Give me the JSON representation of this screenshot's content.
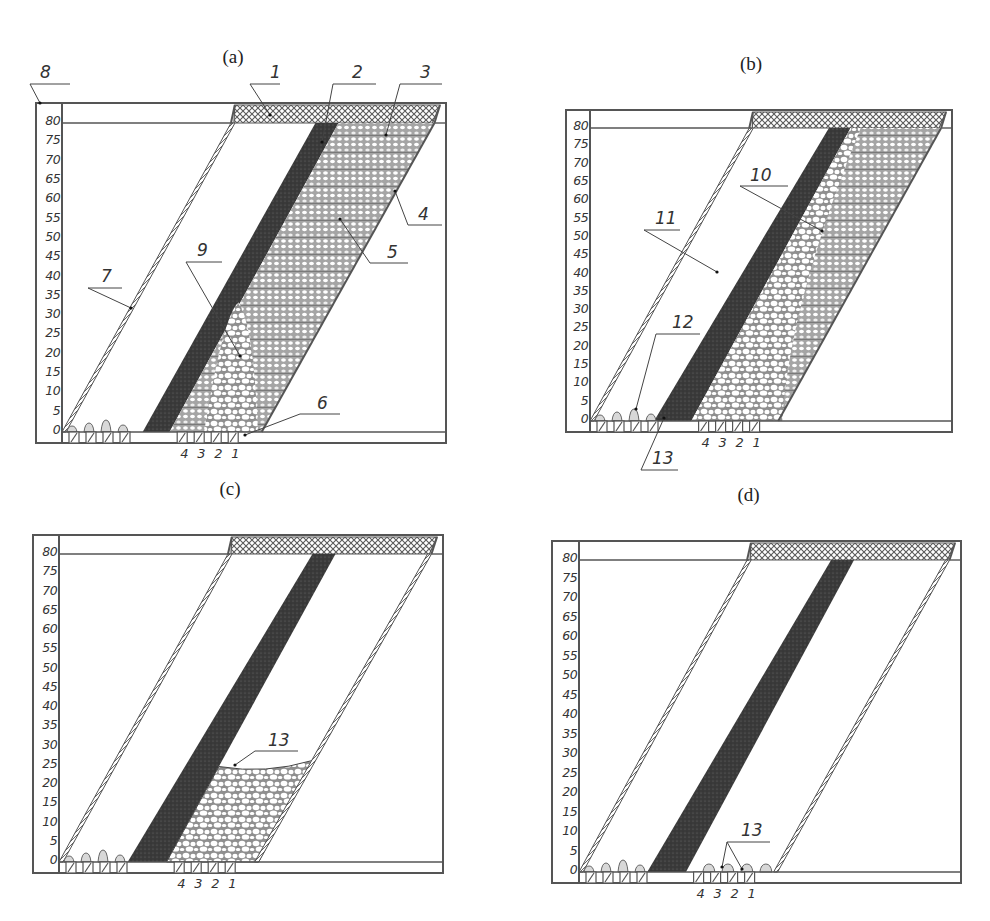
{
  "figure": {
    "scale_ticks": [
      "80",
      "75",
      "70",
      "65",
      "60",
      "55",
      "50",
      "45",
      "40",
      "35",
      "30",
      "25",
      "20",
      "15",
      "10",
      "5",
      "0"
    ],
    "drawpoint_labels": [
      "4",
      "3",
      "2",
      "1"
    ],
    "colors": {
      "line": "#555555",
      "ore": "#3a3a3a",
      "crosshatch": "#6a6a6a",
      "waste_dots": "#8a8a8a",
      "background": "#ffffff"
    }
  },
  "panels": [
    {
      "id": "a",
      "title": "(a)",
      "box": {
        "x": 36,
        "y": 103,
        "w": 410,
        "h": 340,
        "col": 26,
        "band": 20,
        "base": 11
      },
      "state": "initial",
      "callouts": [
        {
          "label": "8",
          "tx": 40,
          "ty": 78,
          "lx": 30,
          "ly": 84,
          "lx2": 70,
          "px": 40,
          "py": 103
        },
        {
          "label": "1",
          "tx": 270,
          "ty": 78,
          "lx": 250,
          "ly": 84,
          "lx2": 280,
          "px": 270,
          "py": 115
        },
        {
          "label": "2",
          "tx": 352,
          "ty": 78,
          "lx": 333,
          "ly": 84,
          "lx2": 376,
          "px": 322,
          "py": 142
        },
        {
          "label": "3",
          "tx": 420,
          "ty": 78,
          "lx": 400,
          "ly": 84,
          "lx2": 442,
          "px": 386,
          "py": 135
        },
        {
          "label": "4",
          "tx": 418,
          "ty": 220,
          "lx": 408,
          "ly": 225,
          "lx2": 442,
          "px": 395,
          "py": 191
        },
        {
          "label": "5",
          "tx": 387,
          "ty": 258,
          "lx": 370,
          "ly": 263,
          "lx2": 408,
          "px": 340,
          "py": 219
        },
        {
          "label": "6",
          "tx": 317,
          "ty": 409,
          "lx": 300,
          "ly": 414,
          "lx2": 340,
          "px": 245,
          "py": 435
        },
        {
          "label": "7",
          "tx": 101,
          "ty": 282,
          "lx": 88,
          "ly": 288,
          "lx2": 122,
          "px": 131,
          "py": 308
        },
        {
          "label": "9",
          "tx": 197,
          "ty": 256,
          "lx": 186,
          "ly": 262,
          "lx2": 222,
          "px": 240,
          "py": 356
        }
      ]
    },
    {
      "id": "b",
      "title": "(b)",
      "box": {
        "x": 566,
        "y": 110,
        "w": 386,
        "h": 322,
        "col": 24,
        "band": 18,
        "base": 11
      },
      "state": "drawing",
      "callouts": [
        {
          "label": "10",
          "tx": 750,
          "ty": 181,
          "lx": 740,
          "ly": 186,
          "lx2": 788,
          "px": 822,
          "py": 231
        },
        {
          "label": "11",
          "tx": 655,
          "ty": 224,
          "lx": 644,
          "ly": 230,
          "lx2": 680,
          "px": 717,
          "py": 272
        },
        {
          "label": "12",
          "tx": 672,
          "ty": 328,
          "lx": 656,
          "ly": 334,
          "lx2": 700,
          "px": 636,
          "py": 409
        },
        {
          "label": "13",
          "tx": 652,
          "ty": 464,
          "lx": 641,
          "ly": 470,
          "lx2": 678,
          "px": 664,
          "py": 418
        }
      ]
    },
    {
      "id": "c",
      "title": "(c)",
      "box": {
        "x": 33,
        "y": 535,
        "w": 410,
        "h": 338,
        "col": 26,
        "band": 19,
        "base": 11
      },
      "state": "partially-drawn",
      "callouts": [
        {
          "label": "13",
          "tx": 268,
          "ty": 746,
          "lx": 255,
          "ly": 751,
          "lx2": 298,
          "px": 235,
          "py": 765
        }
      ]
    },
    {
      "id": "d",
      "title": "(d)",
      "box": {
        "x": 552,
        "y": 541,
        "w": 409,
        "h": 342,
        "col": 27,
        "band": 19,
        "base": 11
      },
      "state": "fully-drawn",
      "callouts": [
        {
          "label": "13",
          "tx": 741,
          "ty": 836,
          "lx": 727,
          "ly": 842,
          "lx2": 770,
          "px": 722,
          "py": 867
        },
        {
          "label": "",
          "tx": 0,
          "ty": 0,
          "lx": 727,
          "ly": 842,
          "lx2": 727,
          "px": 742,
          "py": 869
        }
      ]
    }
  ]
}
